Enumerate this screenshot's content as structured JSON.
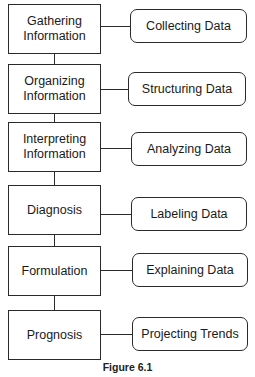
{
  "diagram": {
    "type": "flowchart",
    "steps": [
      {
        "label": "Gathering Information",
        "line1": "Gathering",
        "line2": "Information",
        "activity": "Collecting Data"
      },
      {
        "label": "Organizing Information",
        "line1": "Organizing",
        "line2": "Information",
        "activity": "Structuring Data"
      },
      {
        "label": "Interpreting Information",
        "line1": "Interpreting",
        "line2": "Information",
        "activity": "Analyzing Data"
      },
      {
        "label": "Diagnosis",
        "line1": "Diagnosis",
        "line2": "",
        "activity": "Labeling Data"
      },
      {
        "label": "Formulation",
        "line1": "Formulation",
        "line2": "",
        "activity": "Explaining Data"
      },
      {
        "label": "Prognosis",
        "line1": "Prognosis",
        "line2": "",
        "activity": "Projecting Trends"
      }
    ],
    "caption": "Figure 6.1",
    "colors": {
      "stroke": "#2a2a2a",
      "background": "#ffffff",
      "text": "#1a1a1a"
    }
  }
}
